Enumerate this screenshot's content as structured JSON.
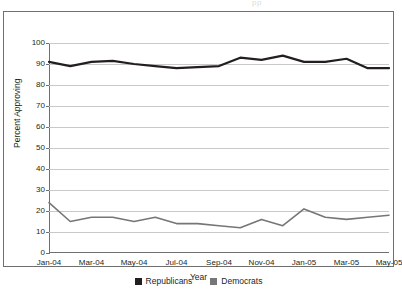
{
  "clipped_header_text": "pp",
  "chart_data": {
    "type": "line",
    "title": "",
    "xlabel": "Year",
    "ylabel": "Percent Approving",
    "ylim": [
      0,
      100
    ],
    "ytick_step": 10,
    "yticks": [
      0,
      10,
      20,
      30,
      40,
      50,
      60,
      70,
      80,
      90,
      100
    ],
    "grid": true,
    "legend_position": "bottom",
    "x_tick_labels": [
      "Jan-04",
      "Mar-04",
      "May-04",
      "Jul-04",
      "Sep-04",
      "Nov-04",
      "Jan-05",
      "Mar-05",
      "May-05"
    ],
    "x": [
      "Jan-04",
      "Feb-04",
      "Mar-04",
      "Apr-04",
      "May-04",
      "Jun-04",
      "Jul-04",
      "Aug-04",
      "Sep-04",
      "Oct-04",
      "Nov-04",
      "Dec-04",
      "Jan-05",
      "Feb-05",
      "Mar-05",
      "Apr-05",
      "May-05"
    ],
    "series": [
      {
        "name": "Republicans",
        "color": "#231f20",
        "values": [
          91,
          89,
          91,
          91.5,
          90,
          89,
          88,
          88.5,
          89,
          93,
          92,
          94,
          91,
          91,
          92.5,
          88,
          88
        ]
      },
      {
        "name": "Democrats",
        "color": "#767676",
        "values": [
          24,
          15,
          17,
          17,
          15,
          17,
          14,
          14,
          13,
          12,
          16,
          13,
          21,
          17,
          16,
          17,
          18
        ]
      }
    ]
  },
  "legend": {
    "items": [
      {
        "label": "Republicans",
        "color": "#231f20"
      },
      {
        "label": "Democrats",
        "color": "#767676"
      }
    ]
  }
}
